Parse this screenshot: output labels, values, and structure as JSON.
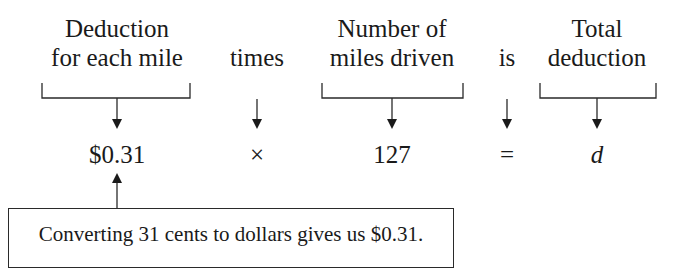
{
  "equation_labels": [
    {
      "line1": "Deduction",
      "line2": "for each mile"
    },
    {
      "line1": "",
      "line2": "times"
    },
    {
      "line1": "Number of",
      "line2": "miles driven"
    },
    {
      "line1": "",
      "line2": "is"
    },
    {
      "line1": "Total",
      "line2": "deduction"
    }
  ],
  "equation_values": [
    "$0.31",
    "×",
    "127",
    "=",
    "d"
  ],
  "note": {
    "text": "Converting 31 cents to dollars gives us $0.31.",
    "points_to": "$0.31"
  },
  "colors": {
    "ink": "#1a1a1a",
    "background": "#ffffff"
  }
}
